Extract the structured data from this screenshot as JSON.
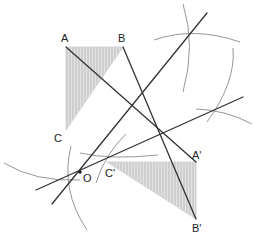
{
  "figure": {
    "type": "geometric-construction",
    "colors": {
      "line": "#333333",
      "arc": "#888888",
      "fill": "#d9d9d9",
      "hatch": "#bdbdbd",
      "label": "#222222"
    }
  },
  "points": {
    "A": {
      "label": "A",
      "x": 66,
      "y": 47
    },
    "B": {
      "label": "B",
      "x": 123,
      "y": 47
    },
    "C": {
      "label": "C",
      "x": 66,
      "y": 130
    },
    "A_prime": {
      "label": "A'",
      "x": 196,
      "y": 162
    },
    "B_prime": {
      "label": "B'",
      "x": 196,
      "y": 219
    },
    "C_prime": {
      "label": "C'",
      "x": 107,
      "y": 162
    },
    "O": {
      "label": "O",
      "x": 80,
      "y": 172
    }
  },
  "labels": {
    "A": "A",
    "B": "B",
    "C": "C",
    "A_prime": "A'",
    "B_prime": "B'",
    "C_prime": "C'",
    "O": "O"
  }
}
